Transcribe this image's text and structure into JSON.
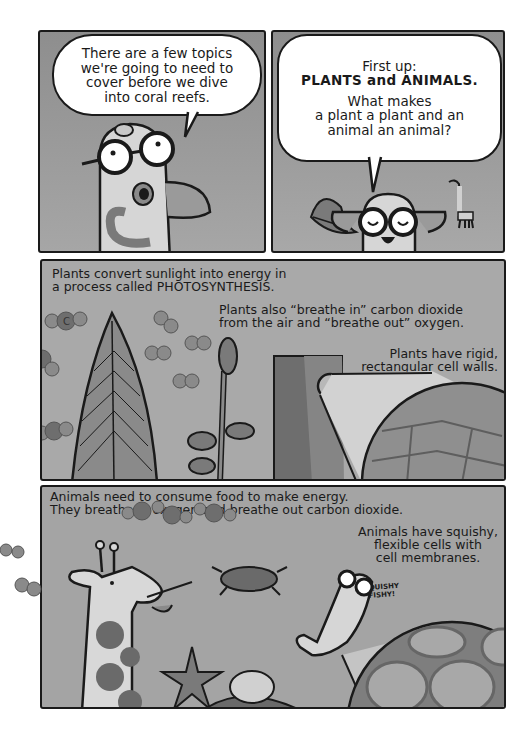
{
  "comic": {
    "panels": [
      {
        "id": "panel-1",
        "speech": "There are a few topics we're going to need to cover before we dive into coral reefs.",
        "speech_lines": [
          "There are a few topics",
          "we're going to need to",
          "cover before we dive",
          "into coral reefs."
        ]
      },
      {
        "id": "panel-2",
        "speech_lines_top": [
          "First up:",
          "PLANTS and ANIMALS."
        ],
        "speech_lines_bottom": [
          "What makes",
          "a plant a plant and an",
          "animal an animal?"
        ]
      },
      {
        "id": "panel-3",
        "caption_1": [
          "Plants convert sunlight into energy in",
          "a process called PHOTOSYNTHESIS."
        ],
        "caption_2": [
          "Plants also “breathe in” carbon dioxide",
          "from the air and “breathe out” oxygen."
        ],
        "caption_3": [
          "Plants have rigid,",
          "rectangular cell walls."
        ]
      },
      {
        "id": "panel-4",
        "caption_1": [
          "Animals need to consume food to make energy.",
          "They breathe in oxygen and breathe out carbon dioxide."
        ],
        "caption_2": [
          "Animals have squishy,",
          "flexible cells with",
          "cell membranes."
        ],
        "sfx": [
          "SQUISHY",
          "FISHY!"
        ]
      }
    ],
    "molecule_label": "C",
    "colors": {
      "panel_bg": "#a9a9a9",
      "ink": "#1a1a1a",
      "bubble": "#ffffff",
      "molecule_dark": "#6e6e6e",
      "molecule_light": "#8a8a8a"
    }
  }
}
